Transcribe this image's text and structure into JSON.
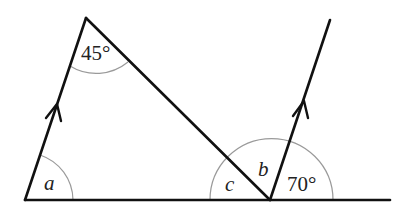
{
  "diagram": {
    "type": "geometry-angles",
    "colors": {
      "line": "#111111",
      "arc": "#9a9a9a",
      "text": "#222222"
    },
    "labels": {
      "top_angle": "45°",
      "left_angle": "a",
      "angle_c": "c",
      "angle_b": "b",
      "right_angle": "70°"
    },
    "points": {
      "A_bottom_left": [
        25,
        200
      ],
      "B_top": [
        86,
        18
      ],
      "C_bottom_right": [
        270,
        200
      ],
      "D_top_right": [
        330,
        20
      ],
      "base_end": [
        390,
        200
      ]
    },
    "parallel_marks": [
      "arrow on left side AB",
      "arrow on line CD"
    ]
  }
}
